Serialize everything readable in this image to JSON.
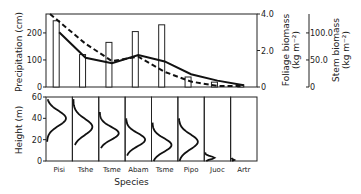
{
  "chart_data": [
    {
      "type": "bar+line",
      "panel": "top",
      "categories": [
        "Pisi",
        "Tshe",
        "Tsme",
        "Abam",
        "Tsme",
        "Pipo",
        "Juoc",
        "Artr"
      ],
      "series": [
        {
          "name": "Precipitation (cm)",
          "kind": "bar",
          "axis": "left",
          "values": [
            245,
            120,
            165,
            205,
            230,
            37,
            18,
            8
          ]
        },
        {
          "name": "Foliage biomass (kg m^-2)",
          "kind": "line",
          "style": "solid",
          "axis": "right1",
          "values": [
            3.0,
            1.6,
            1.3,
            1.75,
            1.4,
            0.7,
            0.35,
            0.1
          ]
        },
        {
          "name": "Stem biomass (kg m^-2)",
          "kind": "line",
          "style": "dashed",
          "axis": "right2",
          "values": [
            132,
            80,
            48,
            56,
            28,
            10,
            2,
            2
          ]
        }
      ],
      "ylabel": "Precipitation (cm)",
      "ylim": [
        0,
        270
      ],
      "yticks": [
        "0",
        "100",
        "200"
      ],
      "y2label": "Foliage biomass (kg m⁻²)",
      "y2lim": [
        0,
        4.0
      ],
      "y2ticks": [
        "0",
        "2.0",
        "4.0"
      ],
      "y3label": "Stem biomass (kg m⁻²)",
      "y3ticks": [
        "0",
        "50.0",
        "100.0"
      ],
      "y3lim": [
        0,
        135
      ]
    },
    {
      "type": "line",
      "panel": "bottom",
      "title": "",
      "categories": [
        "Pisi",
        "Tshe",
        "Tsme",
        "Abam",
        "Tsme",
        "Pipo",
        "Juoc",
        "Artr"
      ],
      "xlabel": "Species",
      "ylabel": "Height (m)",
      "ylim": [
        0,
        60
      ],
      "yticks": [
        "0",
        "20",
        "40",
        "60"
      ],
      "description": "Vertical foliage distribution profiles per species",
      "profiles": [
        {
          "species": "Pisi",
          "peak_height": 40,
          "range": [
            18,
            58
          ]
        },
        {
          "species": "Tshe",
          "peak_height": 32,
          "range": [
            15,
            58
          ]
        },
        {
          "species": "Tsme",
          "peak_height": 26,
          "range": [
            12,
            46
          ]
        },
        {
          "species": "Abam",
          "peak_height": 20,
          "range": [
            5,
            40
          ]
        },
        {
          "species": "Tsme",
          "peak_height": 15,
          "range": [
            0,
            36
          ]
        },
        {
          "species": "Pipo",
          "peak_height": 18,
          "range": [
            0,
            40
          ]
        },
        {
          "species": "Juoc",
          "peak_height": 3,
          "range": [
            0,
            8
          ]
        },
        {
          "species": "Artr",
          "peak_height": 1,
          "range": [
            0,
            3
          ]
        }
      ]
    }
  ],
  "labels": {
    "precip": "Precipitation (cm)",
    "foliage1": "Foliage biomass",
    "foliage2": "(kg m",
    "stem1": "Stem biomass",
    "stem2": "(kg m",
    "height": "Height (m)",
    "species": "Species"
  }
}
